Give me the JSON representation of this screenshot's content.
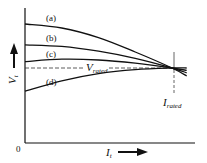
{
  "chart_data": {
    "type": "line",
    "title": "",
    "xlabel": "I_t",
    "ylabel": "V_t",
    "origin_label": "0",
    "x_axis_label": {
      "main": "I",
      "sub": "t"
    },
    "y_axis_label": {
      "main": "V",
      "sub": "t"
    },
    "rated_voltage_label": {
      "main": "V",
      "sub": "rated"
    },
    "rated_current_label": {
      "main": "I",
      "sub": "rated"
    },
    "x_range": [
      0,
      1.15
    ],
    "y_range": [
      0,
      1.6
    ],
    "rated_current": 1.0,
    "rated_voltage": 1.0,
    "series": [
      {
        "name": "(a)",
        "x": [
          0,
          0.25,
          0.5,
          0.75,
          1.0,
          1.1
        ],
        "y": [
          1.55,
          1.5,
          1.38,
          1.2,
          1.0,
          0.9
        ]
      },
      {
        "name": "(b)",
        "x": [
          0,
          0.25,
          0.5,
          0.75,
          1.0,
          1.1
        ],
        "y": [
          1.29,
          1.27,
          1.21,
          1.12,
          1.0,
          0.94
        ]
      },
      {
        "name": "(c)",
        "x": [
          0,
          0.25,
          0.5,
          0.75,
          1.0,
          1.1
        ],
        "y": [
          1.08,
          1.11,
          1.1,
          1.06,
          1.0,
          0.97
        ]
      },
      {
        "name": "(d)",
        "x": [
          0,
          0.25,
          0.5,
          0.75,
          1.0,
          1.1
        ],
        "y": [
          0.71,
          0.84,
          0.93,
          0.98,
          1.0,
          1.0
        ]
      }
    ]
  }
}
